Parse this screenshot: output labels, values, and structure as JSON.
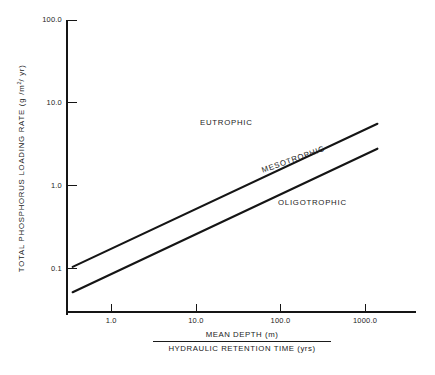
{
  "chart_data": {
    "type": "line",
    "title": "",
    "subtitle": "",
    "xlabel_numerator": "MEAN DEPTH (m)",
    "xlabel_denominator": "HYDRAULIC RETENTION TIME (yrs)",
    "ylabel_text": "TOTAL PHOSPHORUS LOADING RATE (g /m",
    "ylabel_sup": "2",
    "ylabel_tail": "/ yr)",
    "xscale": "log",
    "yscale": "log",
    "xlim": [
      0.3,
      4000.0
    ],
    "ylim": [
      0.03,
      100.0
    ],
    "grid": false,
    "legend": "none",
    "xticks": [
      {
        "value": 1.0,
        "label": "1.0"
      },
      {
        "value": 10.0,
        "label": "10.0"
      },
      {
        "value": 100.0,
        "label": "100.0"
      },
      {
        "value": 1000.0,
        "label": "1000.0"
      }
    ],
    "yticks": [
      {
        "value": 100.0,
        "label": "100.0"
      },
      {
        "value": 10.0,
        "label": "10.0"
      },
      {
        "value": 1.0,
        "label": "1.0"
      },
      {
        "value": 0.1,
        "label": "0.1"
      }
    ],
    "series": [
      {
        "name": "Eutrophic / Mesotrophic boundary",
        "x": [
          0.35,
          1400.0
        ],
        "y": [
          0.105,
          5.6
        ]
      },
      {
        "name": "Mesotrophic / Oligotrophic boundary",
        "x": [
          0.35,
          1400.0
        ],
        "y": [
          0.052,
          2.8
        ]
      }
    ],
    "annotations": [
      {
        "text": "EUTROPHIC",
        "x": 7.0,
        "y": 3.3,
        "rotation": 0
      },
      {
        "text": "MESOTROPHIC",
        "x": 60.0,
        "y": 1.15,
        "rotation": -19.5
      },
      {
        "text": "OLIGOTROPHIC",
        "x": 150.0,
        "y": 0.52,
        "rotation": 0
      }
    ],
    "colors": {
      "line": "#151515",
      "axis": "#151515",
      "text": "#1b1b1b",
      "background": "#ffffff"
    }
  }
}
